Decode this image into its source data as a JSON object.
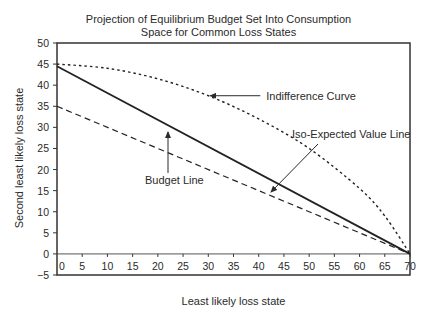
{
  "chart_data": {
    "type": "line",
    "title_lines": [
      "Projection of Equilibrium Budget Set Into Consumption",
      "Space for Common Loss States"
    ],
    "xlabel": "Least likely loss state",
    "ylabel": "Second least likely loss state",
    "xlim": [
      0,
      70
    ],
    "ylim": [
      -5,
      50
    ],
    "x_ticks": [
      0,
      5,
      10,
      15,
      20,
      25,
      30,
      35,
      40,
      45,
      50,
      55,
      60,
      65,
      70
    ],
    "y_ticks": [
      -5,
      0,
      5,
      10,
      15,
      20,
      25,
      30,
      35,
      40,
      45,
      50
    ],
    "grid": false,
    "legend": "none (inline annotations with arrows)",
    "series": [
      {
        "name": "Budget Line",
        "style": "solid",
        "x": [
          0,
          70
        ],
        "y": [
          44.5,
          0
        ]
      },
      {
        "name": "Iso-Expected Value Line",
        "style": "dashed",
        "x": [
          0,
          70
        ],
        "y": [
          35,
          0
        ]
      },
      {
        "name": "Indifference Curve",
        "style": "dotted",
        "x": [
          0,
          10,
          20,
          30,
          40,
          50,
          60,
          65,
          70
        ],
        "y": [
          45,
          44,
          41.5,
          37.5,
          32,
          25,
          15.5,
          9,
          0
        ]
      }
    ],
    "annotations": [
      {
        "text": "Indifference Curve",
        "arrow_to": [
          30,
          37.5
        ]
      },
      {
        "text": "Iso-Expected Value Line",
        "arrow_to": [
          42,
          16
        ]
      },
      {
        "text": "Budget Line",
        "arrow_to": [
          22,
          31
        ]
      }
    ]
  }
}
